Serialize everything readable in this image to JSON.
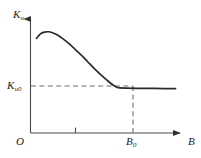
{
  "chart_data": {
    "type": "line",
    "title": "",
    "subtitle": "",
    "xlabel": "B",
    "ylabel": "K_u",
    "xlim": [
      0,
      1.12
    ],
    "ylim": [
      0,
      1.0
    ],
    "grid": false,
    "legend": null,
    "axis_labels": {
      "y_symbol": "K",
      "y_subscript": "u",
      "x_symbol": "B",
      "origin": "O",
      "plateau_symbol": "K",
      "plateau_subscript": "u0",
      "threshold_symbol": "B",
      "threshold_subscript": "0"
    },
    "tick_labels": {
      "x": [
        "O",
        "B₀",
        "B"
      ],
      "y": [
        "Kᵤ₀"
      ]
    },
    "unlabeled_ticks": {
      "x": [
        0.43
      ]
    },
    "annotations": [
      {
        "name": "horizontal-guide",
        "style": "dashed",
        "value_label": "Kᵤ₀",
        "from": [
          0.0,
          0.395
        ],
        "to": [
          0.66,
          0.395
        ]
      },
      {
        "name": "vertical-guide",
        "style": "dashed",
        "value_label": "B₀",
        "from": [
          0.66,
          0.0
        ],
        "to": [
          0.66,
          0.395
        ]
      }
    ],
    "series": [
      {
        "name": "Ku(B)",
        "color": "#2b2b2b",
        "x": [
          0.045,
          0.075,
          0.105,
          0.135,
          0.165,
          0.2,
          0.24,
          0.285,
          0.33,
          0.38,
          0.43,
          0.48,
          0.53,
          0.575,
          0.615,
          0.648,
          0.67,
          0.72,
          0.8,
          0.9,
          1.0,
          1.09
        ],
        "y": [
          0.83,
          0.87,
          0.885,
          0.888,
          0.88,
          0.862,
          0.83,
          0.788,
          0.74,
          0.685,
          0.625,
          0.565,
          0.51,
          0.463,
          0.425,
          0.402,
          0.395,
          0.393,
          0.392,
          0.391,
          0.39,
          0.389
        ]
      }
    ]
  },
  "figure": {
    "background_color": "#ffffff",
    "axis_color": "#4a4a4a",
    "curve_color": "#2b2b2b",
    "guide_color": "#6d6d6d"
  }
}
